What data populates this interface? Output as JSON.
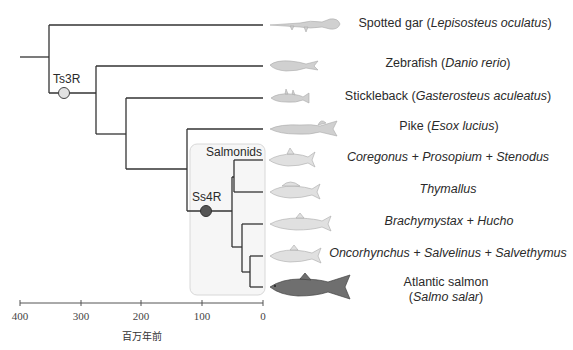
{
  "diagram": {
    "type": "phylogenetic-tree",
    "taxa": [
      {
        "id": "gar",
        "common": "Spotted gar (",
        "italic": "Lepisosteus oculatus",
        "suffix": ")",
        "y": 25
      },
      {
        "id": "zebrafish",
        "common": "Zebrafish (",
        "italic": "Danio rerio",
        "suffix": ")",
        "y": 66
      },
      {
        "id": "stickleback",
        "common": "Stickleback (",
        "italic": "Gasterosteus aculeatus",
        "suffix": ")",
        "y": 98
      },
      {
        "id": "pike",
        "common": "Pike (",
        "italic": "Esox lucius",
        "suffix": ")",
        "y": 129
      },
      {
        "id": "coregonus",
        "common": "",
        "italic": "Coregonus + Prosopium + Stenodus",
        "suffix": "",
        "y": 160
      },
      {
        "id": "thymallus",
        "common": "",
        "italic": "Thymallus",
        "suffix": "",
        "y": 192
      },
      {
        "id": "brachymystax",
        "common": "",
        "italic": "Brachymystax + Hucho",
        "suffix": "",
        "y": 224
      },
      {
        "id": "oncorhynchus",
        "common": "",
        "italic": "Oncorhynchus + Salvelinus + Salvethymus",
        "suffix": "",
        "y": 256
      },
      {
        "id": "salmon",
        "common": "Atlantic salmon",
        "italic": "Salmo salar",
        "suffix": ")",
        "y": 287
      }
    ],
    "nodes": {
      "ts3r": {
        "label": "Ts3R",
        "fill": "#e2e2e2"
      },
      "ss4r": {
        "label": "Ss4R",
        "fill": "#555555"
      }
    },
    "clade_box": {
      "label": "Salmonids"
    },
    "axis": {
      "ticks": [
        "400",
        "300",
        "200",
        "100",
        "0"
      ],
      "title": "百万年前"
    },
    "colors": {
      "branch": "#333333",
      "fish_light": "#d4d4d4",
      "fish_dark": "#6e6e6e",
      "box_fill": "#f7f7f7",
      "box_stroke": "#d6d6d6"
    }
  }
}
